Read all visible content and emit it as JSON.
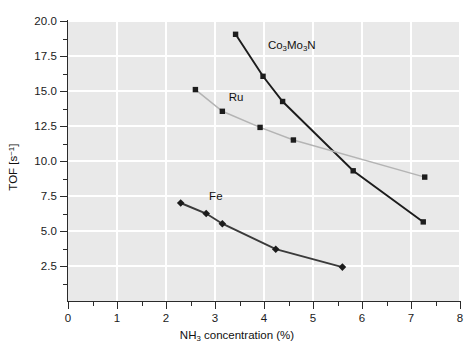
{
  "chart_data": {
    "type": "line",
    "title": "",
    "xlabel": "NH3 concentration (%)",
    "xlabel_parts": {
      "pre": "NH",
      "sub": "3",
      "post": " concentration (%)"
    },
    "ylabel": "TOF [s-1]",
    "ylabel_parts": {
      "pre": "TOF [s",
      "sup": "−1",
      "post": "]"
    },
    "xlim": [
      0,
      8
    ],
    "ylim": [
      0,
      20
    ],
    "grid": true,
    "legend_position": "inline-annotations",
    "xticks": [
      0,
      1,
      2,
      3,
      4,
      5,
      6,
      7,
      8
    ],
    "xtick_labels": [
      "0",
      "1",
      "2",
      "3",
      "4",
      "5",
      "6",
      "7",
      "8"
    ],
    "xticks_minor": [
      0.5,
      1.5,
      2.5,
      3.5,
      4.5,
      5.5,
      6.5,
      7.5
    ],
    "yticks": [
      2.5,
      5.0,
      7.5,
      10.0,
      12.5,
      15.0,
      17.5,
      20.0
    ],
    "ytick_labels": [
      "2.5",
      "5.0",
      "7.5",
      "10.0",
      "12.5",
      "15.0",
      "17.5",
      "20.0"
    ],
    "yticks_minor": [
      1.25,
      3.75,
      6.25,
      8.75,
      11.25,
      13.75,
      16.25,
      18.75
    ],
    "series": [
      {
        "name": "Co3Mo3N",
        "label_parts": [
          {
            "t": "Co",
            "s": "normal"
          },
          {
            "t": "3",
            "s": "sub"
          },
          {
            "t": "Mo",
            "s": "normal"
          },
          {
            "t": "3",
            "s": "sub"
          },
          {
            "t": "N",
            "s": "normal"
          }
        ],
        "marker": "square",
        "color": "#1c1c1c",
        "line_color": "#1c1c1c",
        "x": [
          3.42,
          3.98,
          4.38,
          5.82,
          7.25
        ],
        "y": [
          19.05,
          16.05,
          14.25,
          9.3,
          5.65
        ],
        "label_x": 4.08,
        "label_y": 18.15
      },
      {
        "name": "Ru",
        "label_parts": [
          {
            "t": "Ru",
            "s": "normal"
          }
        ],
        "marker": "square",
        "color": "#1c1c1c",
        "line_color": "#b4b4b4",
        "x": [
          2.6,
          3.15,
          3.92,
          4.6,
          7.28
        ],
        "y": [
          15.1,
          13.55,
          12.4,
          11.5,
          8.85
        ],
        "label_x": 3.28,
        "label_y": 14.45
      },
      {
        "name": "Fe",
        "label_parts": [
          {
            "t": "Fe",
            "s": "normal"
          }
        ],
        "marker": "diamond",
        "color": "#1c1c1c",
        "line_color": "#3a3a3a",
        "x": [
          2.3,
          2.82,
          3.15,
          4.24,
          5.6
        ],
        "y": [
          7.0,
          6.25,
          5.52,
          3.7,
          2.42
        ],
        "label_x": 2.88,
        "label_y": 7.35
      }
    ]
  },
  "colors": {
    "plot_background": "#e9e9e9",
    "gridline": "#ffffff",
    "axis": "#2b2b2b",
    "text": "#111111",
    "ru_line": "#b4b4b4",
    "dark_line": "#1c1c1c"
  }
}
